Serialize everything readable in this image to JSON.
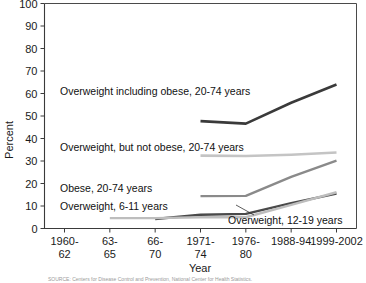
{
  "chart_data": {
    "type": "line",
    "title": "",
    "xlabel": "Year",
    "ylabel": "Percent",
    "ylim": [
      0,
      100
    ],
    "ytick_step": 10,
    "yticks": [
      "0",
      "10",
      "20",
      "30",
      "40",
      "50",
      "60",
      "70",
      "80",
      "90",
      "100"
    ],
    "grid": false,
    "legend_position": "inline-annotations",
    "categories": [
      "1960-62",
      "63-65",
      "66-70",
      "1971-74",
      "1976-80",
      "1988-94",
      "1999-2002"
    ],
    "category_lines": [
      [
        "1960-",
        "62"
      ],
      [
        "63-",
        "65"
      ],
      [
        "66-",
        "70"
      ],
      [
        "1971-",
        "74"
      ],
      [
        "1976-",
        "80"
      ],
      [
        "1988-94",
        ""
      ],
      [
        "1999-2002",
        ""
      ]
    ],
    "series": [
      {
        "name": "Overweight including obese, 20-74 years",
        "color": "#3a3a3a",
        "width": 2.6,
        "values": [
          45.0,
          null,
          null,
          47.7,
          46.6,
          55.9,
          64.0
        ]
      },
      {
        "name": "Overweight, but not obese, 20-74 years",
        "color": "#c4c4c4",
        "width": 2.6,
        "values": [
          31.5,
          null,
          null,
          32.4,
          32.2,
          32.8,
          33.8
        ]
      },
      {
        "name": "Obese, 20-74 years",
        "color": "#8a8a8a",
        "width": 2.4,
        "values": [
          13.0,
          null,
          null,
          14.4,
          14.5,
          22.9,
          30.2
        ]
      },
      {
        "name": "Overweight, 6-11 years",
        "color": "#4a4a4a",
        "width": 2.4,
        "values": [
          null,
          null,
          4.2,
          6.1,
          6.5,
          11.3,
          15.5
        ]
      },
      {
        "name": "Overweight, 12-19 years",
        "color": "#bdbdbd",
        "width": 2.4,
        "values": [
          null,
          4.6,
          4.6,
          5.0,
          5.0,
          10.5,
          16.1
        ]
      }
    ],
    "annotations": [
      {
        "text": "Overweight including obese, 20-74 years",
        "x": 60,
        "y": 95
      },
      {
        "text": "Overweight, but not obese, 20-74 years",
        "x": 60,
        "y": 151
      },
      {
        "text": "Obese, 20-74 years",
        "x": 60,
        "y": 192
      },
      {
        "text": "Overweight, 6-11 years",
        "x": 60,
        "y": 210
      },
      {
        "text": "Overweight, 12-19 years",
        "x": 228,
        "y": 224
      }
    ]
  },
  "source_note": "SOURCE: Centers for Disease Control and Prevention, National Center for Health Statistics."
}
